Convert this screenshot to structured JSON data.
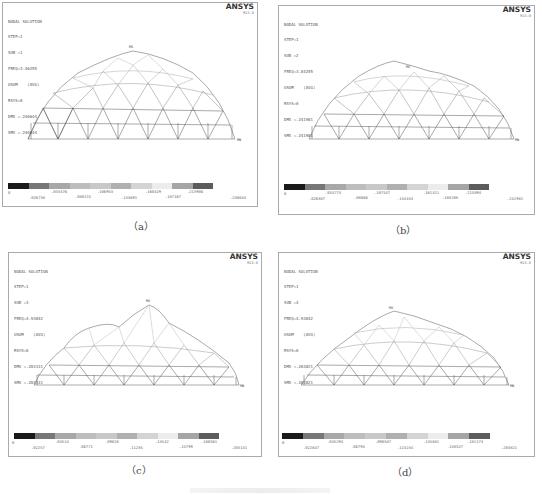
{
  "figure": {
    "caption_prefix": "图 ...",
    "panels": [
      {
        "id": "a",
        "caption": "（a）",
        "header": [
          "NODAL SOLUTION",
          "STEP=1",
          "SUB =1",
          "FREQ=3.46255",
          "USUM    (AVG)",
          "RSYS=0",
          "DMX =.240644",
          "SMX =.240644"
        ],
        "logo": "ANSYS",
        "version": "R15.0",
        "legend_top": [
          "0",
          ".053476",
          ".106953",
          ".160429",
          ".213906"
        ],
        "legend_bottom": [
          ".026738",
          ".080215",
          ".133691",
          ".187167",
          ".240644"
        ],
        "min_label": "MN",
        "max_label": "MX"
      },
      {
        "id": "b",
        "caption": "（b）",
        "header": [
          "NODAL SOLUTION",
          "STEP=1",
          "SUB =2",
          "FREQ=3.84255",
          "USUM    (AVG)",
          "RSYS=0",
          "DMX =.241981",
          "SMX =.241981"
        ],
        "logo": "ANSYS",
        "version": "R15.0",
        "legend_top": [
          "0",
          ".053774",
          ".107547",
          ".161321",
          ".215094"
        ],
        "legend_bottom": [
          ".026887",
          ".08066",
          ".134434",
          ".188208",
          ".241981"
        ],
        "min_label": "MN",
        "max_label": "MX"
      },
      {
        "id": "c",
        "caption": "（c）",
        "header": [
          "NODAL SOLUTION",
          "STEP=1",
          "SUB =3",
          "FREQ=4.93842",
          "USUM    (AVG)",
          "RSYS=0",
          "DMX =.203131",
          "SMX =.203131"
        ],
        "logo": "ANSYS",
        "version": "R15.0",
        "legend_top": [
          "0",
          ".04514",
          ".09028",
          ".13542",
          ".180561"
        ],
        "legend_bottom": [
          ".02257",
          ".06771",
          ".11285",
          ".15799",
          ".203131"
        ],
        "min_label": "MN",
        "max_label": "MX"
      },
      {
        "id": "d",
        "caption": "（d）",
        "header": [
          "NODAL SOLUTION",
          "STEP=1",
          "SUB =4",
          "FREQ=4.93842",
          "USUM    (AVG)",
          "RSYS=0",
          "DMX =.203821",
          "SMX =.203821"
        ],
        "logo": "ANSYS",
        "version": "R15.0",
        "legend_top": [
          "0",
          ".045294",
          ".090587",
          ".135881",
          ".181174"
        ],
        "legend_bottom": [
          ".022647",
          ".06794",
          ".113234",
          ".158527",
          ".203821"
        ],
        "min_label": "MN",
        "max_label": "MX"
      }
    ],
    "legend_colors": [
      "#1a1a1a",
      "#777777",
      "#a8a8a8",
      "#bdbdbd",
      "#c8c8c8",
      "#b0b0b0",
      "#d4d4d4",
      "#ececec",
      "#a5a5a5",
      "#5c5c5c"
    ]
  }
}
